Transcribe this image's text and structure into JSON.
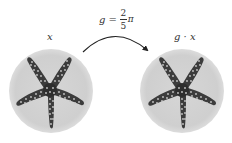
{
  "diagram": {
    "formula": {
      "lhs": "g",
      "equals": "=",
      "numerator": "2",
      "denominator": "5",
      "constant": "π"
    },
    "left_label": "x",
    "right_label": "g · x",
    "colors": {
      "disc_fill": "#d2d2d2",
      "starfish": "#3c3c3c",
      "starfish_dots": "#c8c8c8",
      "arrow": "#222222",
      "text": "#333333"
    },
    "transform": "rotation by 2/5 π (72°) — starfish appears identical due to 5-fold symmetry"
  }
}
